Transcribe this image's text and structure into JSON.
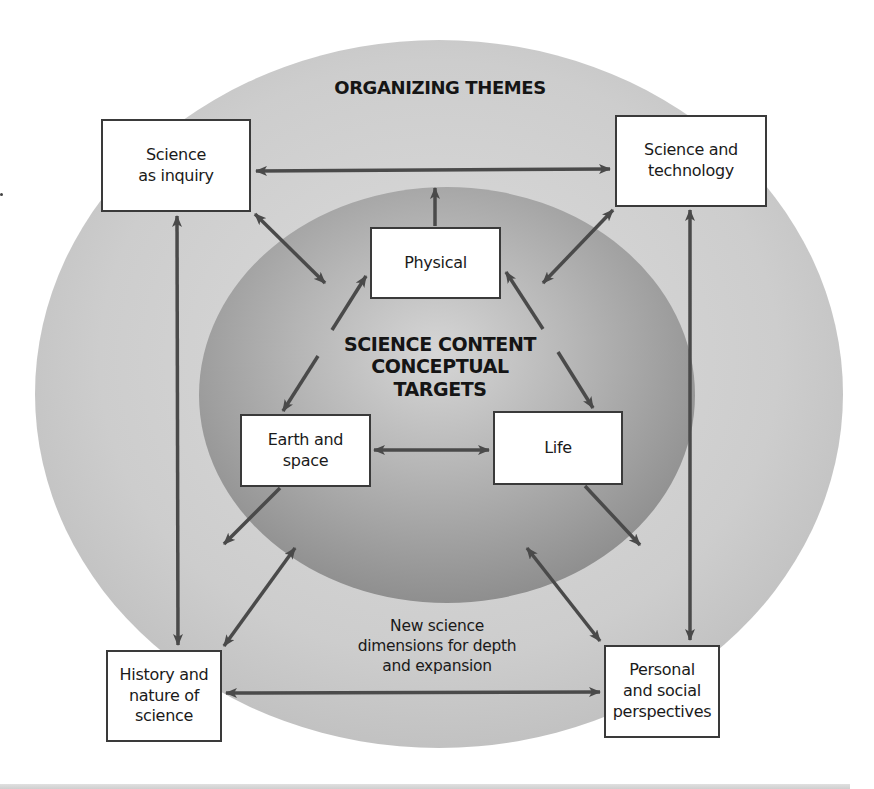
{
  "diagram": {
    "outer_title": "ORGANIZING THEMES",
    "inner_title": "SCIENCE CONTENT\nCONCEPTUAL\nTARGETS",
    "bottom_caption": "New science\ndimensions for depth\nand expansion",
    "theme_boxes": [
      {
        "id": "science-as-inquiry",
        "label": "Science\nas inquiry"
      },
      {
        "id": "science-and-technology",
        "label": "Science and\ntechnology"
      },
      {
        "id": "history-and-nature-of-science",
        "label": "History and\nnature of\nscience"
      },
      {
        "id": "personal-and-social-perspectives",
        "label": "Personal\nand social\nperspectives"
      }
    ],
    "content_boxes": [
      {
        "id": "physical",
        "label": "Physical"
      },
      {
        "id": "earth-and-space",
        "label": "Earth and\nspace"
      },
      {
        "id": "life",
        "label": "Life"
      }
    ],
    "connections": [
      {
        "from": "science-as-inquiry",
        "to": "science-and-technology",
        "type": "bidirectional"
      },
      {
        "from": "science-as-inquiry",
        "to": "history-and-nature-of-science",
        "type": "bidirectional"
      },
      {
        "from": "science-and-technology",
        "to": "personal-and-social-perspectives",
        "type": "bidirectional"
      },
      {
        "from": "history-and-nature-of-science",
        "to": "personal-and-social-perspectives",
        "type": "bidirectional"
      },
      {
        "from": "science-as-inquiry",
        "to": "science-content-core",
        "type": "bidirectional"
      },
      {
        "from": "science-and-technology",
        "to": "science-content-core",
        "type": "bidirectional"
      },
      {
        "from": "history-and-nature-of-science",
        "to": "science-content-core",
        "type": "bidirectional"
      },
      {
        "from": "personal-and-social-perspectives",
        "to": "science-content-core",
        "type": "bidirectional"
      },
      {
        "from": "physical",
        "to": "outer-themes",
        "type": "outward"
      },
      {
        "from": "earth-and-space",
        "to": "outer-themes",
        "type": "outward"
      },
      {
        "from": "life",
        "to": "outer-themes",
        "type": "outward"
      },
      {
        "from": "earth-and-space",
        "to": "life",
        "type": "bidirectional"
      },
      {
        "from": "earth-and-space",
        "to": "physical",
        "type": "bidirectional"
      },
      {
        "from": "physical",
        "to": "life",
        "type": "bidirectional"
      }
    ]
  },
  "colors": {
    "outer_ellipse": "#c9c9c9",
    "inner_ellipse_center": "#d2d2d2",
    "inner_ellipse_edge": "#8f8f8f",
    "arrow": "#4a4a4a",
    "box_border": "#3a3a3a",
    "box_fill": "#ffffff"
  }
}
